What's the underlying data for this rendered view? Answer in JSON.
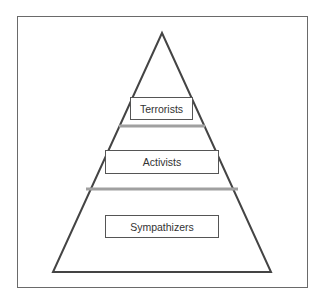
{
  "diagram": {
    "type": "pyramid",
    "levels": [
      {
        "label": "Terrorists",
        "position": "top"
      },
      {
        "label": "Activists",
        "position": "middle"
      },
      {
        "label": "Sympathizers",
        "position": "bottom"
      }
    ],
    "colors": {
      "outline": "#444444",
      "divider": "#a0a0a0",
      "frame": "#6a6a6a",
      "text": "#333333"
    }
  }
}
